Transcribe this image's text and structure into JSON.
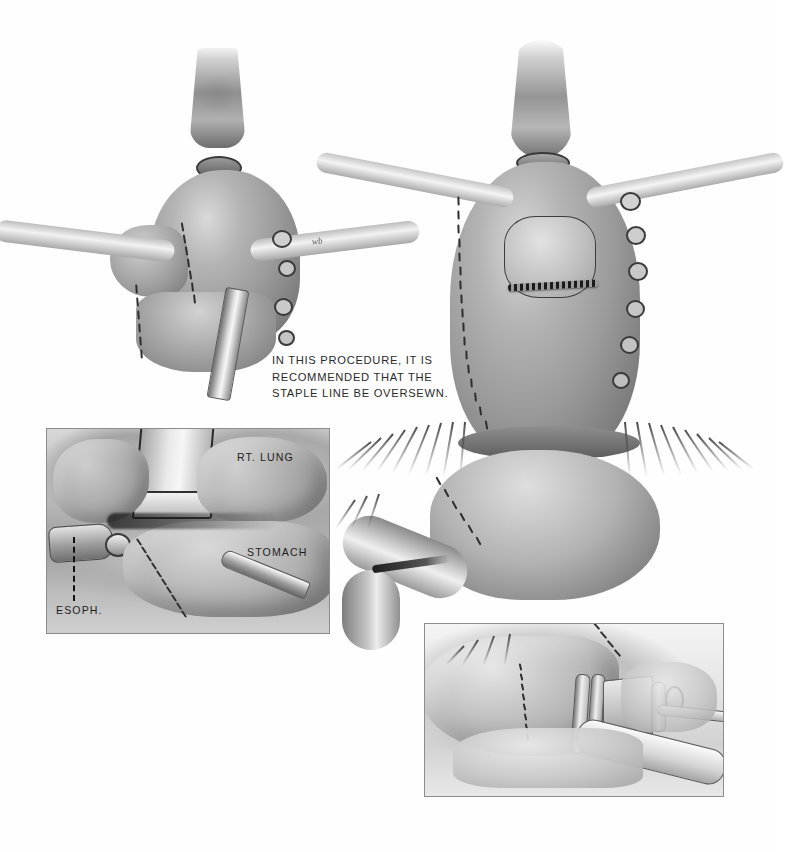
{
  "document": {
    "kind": "surgical-illustration-plate",
    "title": "Esophagogastric anastomosis — staple line oversewing",
    "background_color": "#fefefe",
    "ink_color": "#2b2b2b",
    "width": 773,
    "height": 852
  },
  "caption": {
    "text": "IN THIS PROCEDURE, IT IS\nRECOMMENDED THAT THE\nSTAPLE LINE BE OVERSEWN.",
    "lines": [
      "IN THIS PROCEDURE, IT IS",
      "RECOMMENDED THAT THE",
      "STAPLE LINE BE OVERSEWN."
    ]
  },
  "figures": [
    {
      "id": "fig-upper-left",
      "name": "anastomosis-with-eea-stapler",
      "description": "Esophagus anastomosed to gastric fundus with circular stapler shaft exiting inferiorly",
      "signature": "wb"
    },
    {
      "id": "fig-main",
      "name": "gastric-conduit-overview",
      "description": "Gastric conduit with esophagus anastomosed at apex, oversewn staple line, omental fringe"
    }
  ],
  "insets": [
    {
      "id": "inset-left",
      "name": "intraoperative-view-right-chest",
      "labels": [
        {
          "id": "rt-lung",
          "text": "RT. LUNG"
        },
        {
          "id": "stomach",
          "text": "STOMACH"
        },
        {
          "id": "esoph",
          "text": "ESOPH.",
          "has_leader": true
        }
      ]
    },
    {
      "id": "inset-right",
      "name": "stapler-application-view",
      "labels": []
    }
  ],
  "palette": {
    "paper": "#fefefe",
    "tissue_light": "#d9d9d9",
    "tissue_mid": "#9a9a9a",
    "tissue_dark": "#5f5f5f",
    "suture": "#2e2e2e",
    "panel_border": "#8d8d91",
    "text": "#2b2b2b"
  }
}
